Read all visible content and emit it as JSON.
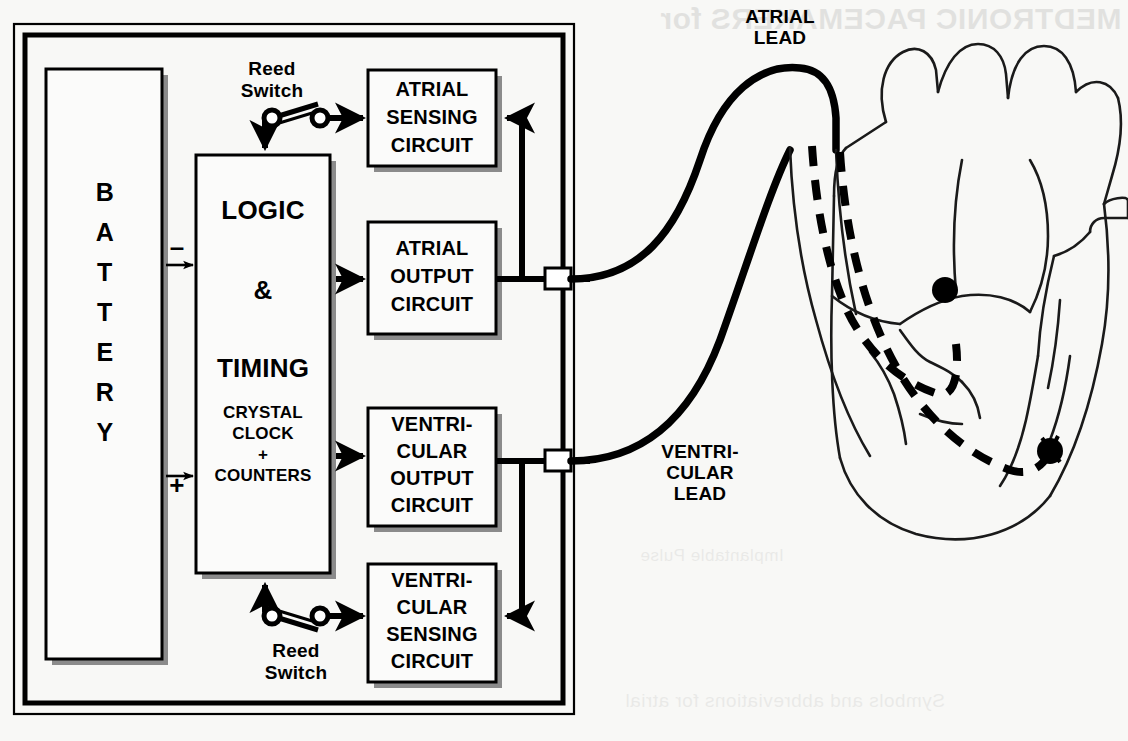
{
  "diagram": {
    "device_case": {
      "name": "pacemaker-can"
    },
    "blocks": {
      "battery": {
        "label": "BATTERY",
        "orientation": "vertical"
      },
      "logic": {
        "line1": "LOGIC",
        "line2": "&",
        "line3": "TIMING",
        "sub1": "CRYSTAL",
        "sub2": "CLOCK",
        "sub3": "+",
        "sub4": "COUNTERS"
      },
      "atrial_sensing": {
        "line1": "ATRIAL",
        "line2": "SENSING",
        "line3": "CIRCUIT"
      },
      "atrial_output": {
        "line1": "ATRIAL",
        "line2": "OUTPUT",
        "line3": "CIRCUIT"
      },
      "vent_output": {
        "line1": "VENTRI-",
        "line2": "CULAR",
        "line3": "OUTPUT",
        "line4": "CIRCUIT"
      },
      "vent_sensing": {
        "line1": "VENTRI-",
        "line2": "CULAR",
        "line3": "SENSING",
        "line4": "CIRCUIT"
      }
    },
    "reed_switch_top": {
      "line1": "Reed",
      "line2": "Switch"
    },
    "reed_switch_bottom": {
      "line1": "Reed",
      "line2": "Switch"
    },
    "battery_terminals": {
      "negative": "–",
      "positive": "+"
    },
    "leads": {
      "atrial": {
        "line1": "ATRIAL",
        "line2": "LEAD"
      },
      "ventricular": {
        "line1": "VENTRI-",
        "line2": "CULAR",
        "line3": "LEAD"
      }
    },
    "heart": {
      "name": "heart-anatomy",
      "atrial_electrode": "atrial-electrode-tip",
      "ventricular_electrode": "ventricular-electrode-tip"
    },
    "colors": {
      "ink": "#000000",
      "paper": "#f8f8f6",
      "shadow": "#8b8b8b",
      "block_fill": "#fbfbfa",
      "heart_line": "#1a1a1a"
    }
  },
  "bleed_through": {
    "header": "MEDTRONIC PACEMAKERS for",
    "line_a": "Implantable Pulse",
    "line_b": "Symbols and abbreviations for atrial"
  }
}
